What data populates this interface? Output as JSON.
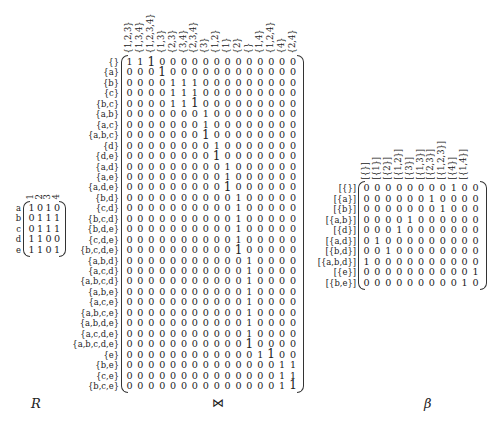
{
  "captions": {
    "R": "R",
    "join": "⋈",
    "beta": "β"
  },
  "R": {
    "row_labels": [
      "a",
      "b",
      "c",
      "d",
      "e"
    ],
    "col_labels": [
      "1",
      "2",
      "3",
      "4"
    ],
    "rows": [
      [
        1,
        0,
        1,
        0
      ],
      [
        0,
        1,
        1,
        1
      ],
      [
        0,
        1,
        1,
        1
      ],
      [
        1,
        1,
        0,
        0
      ],
      [
        1,
        1,
        0,
        1
      ]
    ]
  },
  "join": {
    "row_labels": [
      "{}",
      "{a}",
      "{b}",
      "{c}",
      "{b,c}",
      "{a,b}",
      "{a,c}",
      "{a,b,c}",
      "{d}",
      "{d,e}",
      "{a,d}",
      "{a,e}",
      "{a,d,e}",
      "{b,d}",
      "{c,d}",
      "{b,c,d}",
      "{b,d,e}",
      "{c,d,e}",
      "{b,c,d,e}",
      "{a,b,d}",
      "{a,c,d}",
      "{a,b,c,d}",
      "{a,b,e}",
      "{a,c,e}",
      "{a,b,c,e}",
      "{a,b,d,e}",
      "{a,c,d,e}",
      "{a,b,c,d,e}",
      "{e}",
      "{b,e}",
      "{c,e}",
      "{b,c,e}"
    ],
    "col_labels": [
      "{1,2,3}",
      "{1,3,4}",
      "{1,2,3,4}",
      "{1,3}",
      "{2,3}",
      "{3,4}",
      "{2,3,4}",
      "{3}",
      "{1,2}",
      "{1}",
      "{2}",
      "{}",
      "{1,4}",
      "{1,2,4}",
      "{4}",
      "{2,4}"
    ],
    "one_col_per_row": [
      [
        0,
        1,
        2
      ],
      [
        3
      ],
      [
        4,
        5,
        6
      ],
      [
        4,
        5,
        6
      ],
      [
        4,
        5,
        6
      ],
      [
        7
      ],
      [
        7
      ],
      [
        7
      ],
      [
        8
      ],
      [
        8
      ],
      [
        9
      ],
      [
        9
      ],
      [
        9
      ],
      [
        10
      ],
      [
        10
      ],
      [
        10
      ],
      [
        10
      ],
      [
        10
      ],
      [
        10
      ],
      [
        11
      ],
      [
        11
      ],
      [
        11
      ],
      [
        11
      ],
      [
        11
      ],
      [
        11
      ],
      [
        11
      ],
      [
        11
      ],
      [
        11
      ],
      [
        12,
        13
      ],
      [
        14,
        15
      ],
      [
        14,
        15
      ],
      [
        14,
        15
      ]
    ],
    "emphasized": [
      [
        0,
        2
      ],
      [
        1,
        3
      ],
      [
        4,
        6
      ],
      [
        7,
        7
      ],
      [
        9,
        8
      ],
      [
        12,
        9
      ],
      [
        18,
        10
      ],
      [
        27,
        11
      ],
      [
        28,
        13
      ],
      [
        31,
        15
      ]
    ]
  },
  "beta": {
    "row_labels": [
      "[{}]",
      "[{a}]",
      "[{b}]",
      "[{a,b}]",
      "[{d}]",
      "[{a,d}]",
      "[{b,d}]",
      "[{a,b,d}]",
      "[{e}]",
      "[{b,e}]"
    ],
    "col_labels": [
      "[{}]",
      "[{1}]",
      "[{2}]",
      "[{1,2}]",
      "[{3}]",
      "[{1,3}]",
      "[{2,3}]",
      "[{1,2,3}]",
      "[{4}]",
      "[{1,4}]",
      ""
    ],
    "rows": [
      [
        0,
        0,
        0,
        0,
        0,
        0,
        0,
        0,
        1,
        0,
        0
      ],
      [
        0,
        0,
        0,
        0,
        0,
        0,
        1,
        0,
        0,
        0,
        0
      ],
      [
        0,
        0,
        0,
        0,
        0,
        0,
        0,
        1,
        0,
        0,
        0
      ],
      [
        0,
        0,
        0,
        0,
        1,
        0,
        0,
        0,
        0,
        0,
        0
      ],
      [
        0,
        0,
        0,
        1,
        0,
        0,
        0,
        0,
        0,
        0,
        0
      ],
      [
        0,
        1,
        0,
        0,
        0,
        0,
        0,
        0,
        0,
        0,
        0
      ],
      [
        0,
        0,
        1,
        0,
        0,
        0,
        0,
        0,
        0,
        0,
        0
      ],
      [
        1,
        0,
        0,
        0,
        0,
        0,
        0,
        0,
        0,
        0,
        0
      ],
      [
        0,
        0,
        0,
        0,
        0,
        0,
        0,
        0,
        0,
        0,
        1
      ],
      [
        0,
        0,
        0,
        0,
        0,
        0,
        0,
        0,
        0,
        1,
        0
      ]
    ]
  }
}
